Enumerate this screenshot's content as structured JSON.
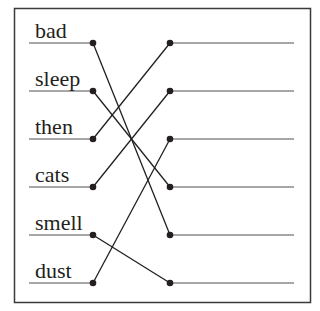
{
  "diagram": {
    "type": "matching-exercise",
    "frame": {
      "x": 14,
      "y": 8,
      "width": 296,
      "height": 294,
      "stroke": "#3a3a3a"
    },
    "colors": {
      "ink": "#231f20",
      "underline": "#8a8a8a",
      "connector": "#231f20"
    },
    "left_items": [
      {
        "label": "bad",
        "y": 43
      },
      {
        "label": "sleep",
        "y": 91
      },
      {
        "label": "then",
        "y": 139
      },
      {
        "label": "cats",
        "y": 187
      },
      {
        "label": "smell",
        "y": 235
      },
      {
        "label": "dust",
        "y": 283
      }
    ],
    "right_slots": [
      {
        "index": 1,
        "y": 43
      },
      {
        "index": 2,
        "y": 91
      },
      {
        "index": 3,
        "y": 139
      },
      {
        "index": 4,
        "y": 187
      },
      {
        "index": 5,
        "y": 235
      },
      {
        "index": 6,
        "y": 283
      }
    ],
    "connections": [
      {
        "from": "bad",
        "to_slot": 5
      },
      {
        "from": "sleep",
        "to_slot": 4
      },
      {
        "from": "then",
        "to_slot": 1
      },
      {
        "from": "cats",
        "to_slot": 2
      },
      {
        "from": "smell",
        "to_slot": 6
      },
      {
        "from": "dust",
        "to_slot": 3
      }
    ]
  }
}
